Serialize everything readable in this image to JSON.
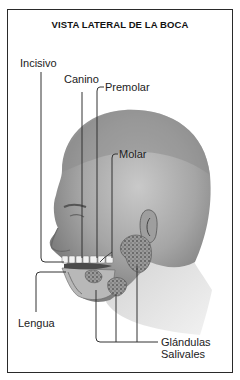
{
  "diagram": {
    "title": "VISTA LATERAL DE LA BOCA",
    "labels": {
      "incisivo": "Incisivo",
      "canino": "Canino",
      "premolar": "Premolar",
      "molar": "Molar",
      "lengua": "Lengua",
      "glandulas_line1": "Glándulas",
      "glandulas_line2": "Salivales"
    },
    "illustration": "head-profile-mouth-anatomy",
    "colors": {
      "border": "#2a2a2a",
      "line": "#333333",
      "skin_dark": "#8a8a8a",
      "skin_light": "#d6d6d6"
    }
  }
}
